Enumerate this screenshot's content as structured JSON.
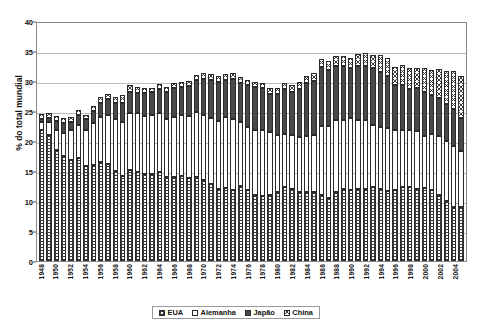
{
  "chart_data": {
    "type": "bar",
    "stacked": true,
    "title": "",
    "xlabel": "",
    "ylabel": "% do total mundial",
    "ylim": [
      0,
      40
    ],
    "yticks": [
      0,
      5,
      10,
      15,
      20,
      25,
      30,
      35,
      40
    ],
    "grid": true,
    "legend_position": "bottom",
    "categories": [
      "1948",
      "1949",
      "1950",
      "1951",
      "1952",
      "1953",
      "1954",
      "1955",
      "1956",
      "1957",
      "1958",
      "1959",
      "1960",
      "1961",
      "1962",
      "1963",
      "1964",
      "1965",
      "1966",
      "1967",
      "1968",
      "1969",
      "1970",
      "1971",
      "1972",
      "1973",
      "1974",
      "1975",
      "1976",
      "1977",
      "1978",
      "1979",
      "1980",
      "1981",
      "1982",
      "1983",
      "1984",
      "1985",
      "1986",
      "1987",
      "1988",
      "1989",
      "1990",
      "1991",
      "1992",
      "1993",
      "1994",
      "1995",
      "1996",
      "1997",
      "1998",
      "1999",
      "2000",
      "2001",
      "2002",
      "2003",
      "2004",
      "2005"
    ],
    "tick_labels": [
      "1948",
      "",
      "1950",
      "",
      "1952",
      "",
      "1954",
      "",
      "1956",
      "",
      "1958",
      "",
      "1960",
      "",
      "1962",
      "",
      "1964",
      "",
      "1966",
      "",
      "1968",
      "",
      "1970",
      "",
      "1972",
      "",
      "1974",
      "",
      "1976",
      "",
      "1978",
      "",
      "1980",
      "",
      "1982",
      "",
      "1984",
      "",
      "1986",
      "",
      "1988",
      "",
      "1990",
      "",
      "1992",
      "",
      "1994",
      "",
      "1996",
      "",
      "1998",
      "",
      "2000",
      "",
      "2002",
      "",
      "2004",
      ""
    ],
    "series": [
      {
        "name": "EUA",
        "pattern": "dotted",
        "values": [
          21.8,
          21.0,
          18.5,
          17.5,
          16.8,
          17.2,
          15.8,
          16.0,
          16.5,
          16.2,
          15.0,
          14.2,
          15.2,
          14.8,
          14.5,
          14.5,
          14.8,
          14.0,
          14.0,
          14.2,
          13.8,
          14.0,
          13.5,
          12.8,
          12.0,
          12.2,
          11.8,
          12.5,
          11.8,
          11.0,
          10.8,
          11.0,
          11.5,
          12.3,
          12.0,
          11.5,
          11.5,
          11.5,
          11.0,
          10.5,
          11.5,
          12.0,
          11.8,
          12.0,
          12.0,
          12.3,
          12.0,
          11.6,
          11.8,
          12.3,
          12.3,
          12.0,
          12.1,
          11.8,
          11.0,
          10.0,
          9.0,
          9.0
        ]
      },
      {
        "name": "Alemanha",
        "pattern": "white",
        "values": [
          1.4,
          2.2,
          3.4,
          3.9,
          5.0,
          5.5,
          6.0,
          7.0,
          7.5,
          8.2,
          8.6,
          9.0,
          9.5,
          9.8,
          9.7,
          9.8,
          9.8,
          9.6,
          10.0,
          10.2,
          10.4,
          10.8,
          10.9,
          11.0,
          11.3,
          11.8,
          11.8,
          10.6,
          10.5,
          10.8,
          11.0,
          10.5,
          9.5,
          8.8,
          9.0,
          9.2,
          9.3,
          9.5,
          11.5,
          12.0,
          12.0,
          11.5,
          12.0,
          11.5,
          11.5,
          10.3,
          10.3,
          10.6,
          10.0,
          9.5,
          9.6,
          9.6,
          8.8,
          9.4,
          9.8,
          10.0,
          10.2,
          9.4
        ]
      },
      {
        "name": "Japão",
        "pattern": "solid-dark",
        "values": [
          0.4,
          0.6,
          1.4,
          1.6,
          1.4,
          1.6,
          1.8,
          2.0,
          2.4,
          2.6,
          2.8,
          3.2,
          3.4,
          3.4,
          3.8,
          3.8,
          4.1,
          4.5,
          4.8,
          4.6,
          5.0,
          5.4,
          6.0,
          6.4,
          6.6,
          6.2,
          6.8,
          6.6,
          7.0,
          7.2,
          7.0,
          6.3,
          6.8,
          7.5,
          7.2,
          8.0,
          8.8,
          9.0,
          9.8,
          9.3,
          9.0,
          9.0,
          8.3,
          9.0,
          9.0,
          9.5,
          9.2,
          8.6,
          7.6,
          7.5,
          6.8,
          7.2,
          7.3,
          6.4,
          6.4,
          6.1,
          6.1,
          5.5
        ]
      },
      {
        "name": "China",
        "pattern": "cross-hatch",
        "values": [
          0.9,
          0.9,
          0.9,
          0.9,
          0.8,
          0.9,
          0.8,
          0.8,
          0.9,
          0.9,
          1.0,
          1.2,
          1.2,
          1.0,
          0.9,
          0.8,
          0.8,
          0.9,
          0.9,
          0.8,
          0.8,
          0.8,
          0.9,
          0.9,
          1.0,
          1.0,
          0.9,
          1.0,
          0.8,
          0.8,
          0.9,
          1.0,
          1.0,
          1.1,
          1.2,
          1.2,
          1.3,
          1.4,
          1.4,
          1.6,
          1.7,
          1.7,
          1.8,
          2.0,
          2.2,
          2.3,
          2.8,
          3.0,
          3.0,
          3.4,
          3.4,
          3.4,
          3.9,
          4.3,
          4.8,
          5.5,
          6.4,
          7.0
        ]
      }
    ]
  },
  "legend": {
    "items": [
      {
        "label": "EUA",
        "swatch": "dotted-swatch"
      },
      {
        "label": "Alemanha",
        "swatch": "white-swatch"
      },
      {
        "label": "Japão",
        "swatch": "dark-swatch"
      },
      {
        "label": "China",
        "swatch": "hatch-swatch"
      }
    ]
  },
  "axis": {
    "y_title": "% do total mundial"
  }
}
